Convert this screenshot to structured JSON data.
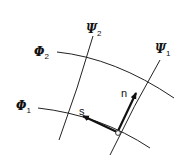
{
  "diagram": {
    "type": "flow net (orthogonal curvilinear grid)",
    "labels": {
      "phi1": {
        "symbol": "Φ",
        "subscript": "1"
      },
      "phi2": {
        "symbol": "Φ",
        "subscript": "2"
      },
      "psi1": {
        "symbol": "Ψ",
        "subscript": "1"
      },
      "psi2": {
        "symbol": "Ψ",
        "subscript": "2"
      },
      "s": "s",
      "n": "n"
    },
    "curves": [
      {
        "name": "Φ1",
        "kind": "equipotential line"
      },
      {
        "name": "Φ2",
        "kind": "equipotential line"
      },
      {
        "name": "Ψ1",
        "kind": "stream line"
      },
      {
        "name": "Ψ2",
        "kind": "stream line"
      }
    ],
    "vectors": [
      {
        "name": "s",
        "direction": "tangent along Φ1"
      },
      {
        "name": "n",
        "direction": "normal along Ψ1"
      }
    ],
    "colors": {
      "line": "#222222",
      "background": "#ffffff"
    }
  }
}
